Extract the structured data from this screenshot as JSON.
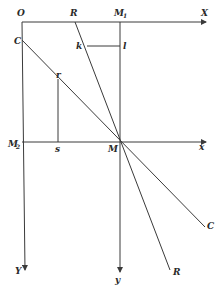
{
  "diagram": {
    "stroke_color": "#3a3a3a",
    "labels": {
      "O": "O",
      "R_top": "R",
      "M1": "M",
      "M1_sub": "1",
      "X": "X",
      "C_top": "C",
      "k": "k",
      "l": "l",
      "r": "r",
      "M2": "M",
      "M2_sub": "2",
      "s": "s",
      "M": "M",
      "x": "x",
      "C_bottom": "C",
      "Y": "Y",
      "y": "y",
      "R_bottom": "R"
    }
  }
}
